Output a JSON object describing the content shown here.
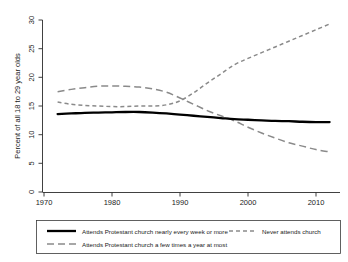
{
  "chart_data": {
    "type": "line",
    "title": "",
    "xlabel": "",
    "ylabel": "Percent of all 18 to 29 year olds",
    "xlim": [
      1970,
      2013
    ],
    "ylim": [
      0,
      30
    ],
    "xticks": [
      1970,
      1980,
      1990,
      2000,
      2010
    ],
    "yticks": [
      0,
      5,
      10,
      15,
      20,
      25,
      30
    ],
    "grid": false,
    "legend_position": "bottom",
    "x": [
      1972,
      1974,
      1976,
      1978,
      1980,
      1982,
      1984,
      1986,
      1988,
      1990,
      1992,
      1994,
      1996,
      1998,
      2000,
      2002,
      2004,
      2006,
      2008,
      2010,
      2012
    ],
    "series": [
      {
        "name": "Attends Protestant church nearly every week or more",
        "style": "solid",
        "color": "#000000",
        "values": [
          13.6,
          13.7,
          13.8,
          13.85,
          13.9,
          13.95,
          13.95,
          13.85,
          13.7,
          13.5,
          13.3,
          13.1,
          12.9,
          12.7,
          12.6,
          12.5,
          12.4,
          12.35,
          12.25,
          12.2,
          12.2
        ]
      },
      {
        "name": "Never attends church",
        "style": "short-dash",
        "color": "#8a8a8a",
        "values": [
          15.7,
          15.3,
          15.1,
          15.0,
          14.9,
          14.9,
          15.0,
          15.0,
          15.2,
          15.9,
          17.3,
          19.0,
          20.6,
          22.2,
          23.3,
          24.3,
          25.3,
          26.3,
          27.3,
          28.3,
          29.3
        ]
      },
      {
        "name": "Attends Protestant church a few times a year at most",
        "style": "long-dash",
        "color": "#8a8a8a",
        "values": [
          17.5,
          17.9,
          18.2,
          18.45,
          18.5,
          18.45,
          18.3,
          18.0,
          17.4,
          16.4,
          15.3,
          14.2,
          13.3,
          12.4,
          11.3,
          10.3,
          9.4,
          8.6,
          8.0,
          7.4,
          7.0
        ]
      }
    ],
    "annotations": []
  },
  "axis": {
    "y_title": "Percent of all 18 to 29 year olds",
    "y_tick_0": "0",
    "y_tick_5": "5",
    "y_tick_10": "10",
    "y_tick_15": "15",
    "y_tick_20": "20",
    "y_tick_25": "25",
    "y_tick_30": "30",
    "x_tick_1970": "1970",
    "x_tick_1980": "1980",
    "x_tick_1990": "1990",
    "x_tick_2000": "2000",
    "x_tick_2010": "2010"
  },
  "legend": {
    "entry_weekly": "Attends Protestant church nearly every week or more",
    "entry_never": "Never attends church",
    "entry_fewtimes": "Attends Protestant church a few times a year at most"
  }
}
